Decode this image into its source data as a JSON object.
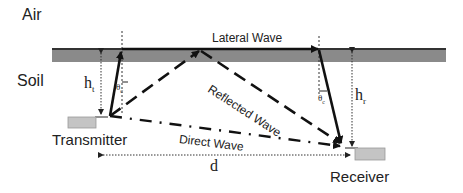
{
  "labels": {
    "air": "Air",
    "soil": "Soil",
    "lateral_wave": "Lateral Wave",
    "reflected_wave": "Reflected Wave",
    "direct_wave": "Direct Wave",
    "transmitter": "Transmitter",
    "receiver": "Receiver",
    "h_t": "h",
    "h_t_sub": "t",
    "h_r": "h",
    "h_r_sub": "r",
    "theta_t": "θ",
    "theta_t_sub": "c",
    "theta_r": "θ",
    "theta_r_sub": "c",
    "distance": "d"
  },
  "colors": {
    "interface_band": "#8a8a8a",
    "interface_edge": "#333333",
    "antenna_box": "#c4c4c4",
    "line": "#111111"
  }
}
